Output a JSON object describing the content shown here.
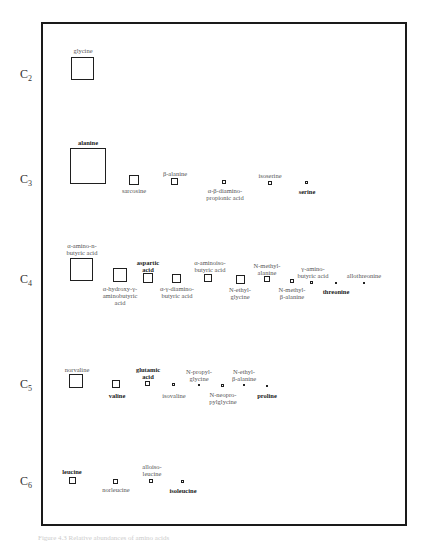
{
  "figure": {
    "type": "amino acid abundance grid by carbon number",
    "rows": [
      {
        "label": "C",
        "sub": "2",
        "y": 75,
        "items": [
          {
            "name": "glycine",
            "bold": false,
            "box": [
              71,
              57,
              23
            ],
            "label_pos": [
              83,
              47
            ],
            "lines": [
              "glycine"
            ]
          }
        ]
      },
      {
        "label": "C",
        "sub": "3",
        "y": 180,
        "items": [
          {
            "name": "alanine",
            "bold": true,
            "box": [
              70,
              148,
              36
            ],
            "label_pos": [
              88,
              139
            ],
            "lines": [
              "alanine"
            ]
          },
          {
            "name": "sarcosine",
            "bold": false,
            "box": [
              129,
              175,
              10
            ],
            "label_pos": [
              134,
              187
            ],
            "lines": [
              "sarcosine"
            ]
          },
          {
            "name": "β-alanine",
            "bold": false,
            "box": [
              171,
              178,
              7
            ],
            "label_pos": [
              175,
              170
            ],
            "lines": [
              "β-alanine"
            ]
          },
          {
            "name": "α-β-diamino-propionic acid",
            "bold": false,
            "box": [
              222,
              180,
              4
            ],
            "label_pos": [
              225,
              187
            ],
            "lines": [
              "α-β-diamino-",
              "propionic acid"
            ]
          },
          {
            "name": "isoserine",
            "bold": false,
            "box": [
              268,
              181,
              4
            ],
            "label_pos": [
              270,
              172
            ],
            "lines": [
              "isoserine"
            ]
          },
          {
            "name": "serine",
            "bold": true,
            "box": [
              305,
              181,
              3
            ],
            "label_pos": [
              307,
              188
            ],
            "lines": [
              "serine"
            ]
          }
        ]
      },
      {
        "label": "C",
        "sub": "4",
        "y": 280,
        "items": [
          {
            "name": "α-amino-n-butyric acid",
            "bold": false,
            "box": [
              70,
              258,
              23
            ],
            "label_pos": [
              82,
              242
            ],
            "lines": [
              "α-amino-n-",
              "butyric acid"
            ]
          },
          {
            "name": "α-hydroxy-γ-aminobutyric acid",
            "bold": false,
            "box": [
              113,
              268,
              14
            ],
            "label_pos": [
              120,
              285
            ],
            "lines": [
              "α-hydroxy-γ-",
              "aminobutyric",
              "acid"
            ]
          },
          {
            "name": "aspartic acid",
            "bold": true,
            "box": [
              143,
              273,
              10
            ],
            "label_pos": [
              148,
              259
            ],
            "lines": [
              "aspartic",
              "acid"
            ]
          },
          {
            "name": "α-γ-diamino-butyric acid",
            "bold": false,
            "box": [
              172,
              274,
              9
            ],
            "label_pos": [
              177,
              285
            ],
            "lines": [
              "α-γ-diamino-",
              "butyric acid"
            ]
          },
          {
            "name": "α-aminoiso-butyric acid",
            "bold": false,
            "box": [
              204,
              274,
              8
            ],
            "label_pos": [
              210,
              259
            ],
            "lines": [
              "α-aminoiso-",
              "butyric acid"
            ]
          },
          {
            "name": "N-ethylglycine",
            "bold": false,
            "box": [
              236,
              275,
              9
            ],
            "label_pos": [
              240,
              286
            ],
            "lines": [
              "N-ethyl-",
              "glycine"
            ]
          },
          {
            "name": "N-methylalanine",
            "bold": false,
            "box": [
              264,
              276,
              6
            ],
            "label_pos": [
              267,
              262
            ],
            "lines": [
              "N-methyl-",
              "alanine"
            ]
          },
          {
            "name": "N-methyl-β-alanine",
            "bold": false,
            "box": [
              290,
              279,
              4
            ],
            "label_pos": [
              292,
              286
            ],
            "lines": [
              "N-methyl-",
              "β-alanine"
            ]
          },
          {
            "name": "γ-aminobutyric acid",
            "bold": false,
            "box": [
              310,
              281,
              3
            ],
            "label_pos": [
              313,
              265
            ],
            "lines": [
              "γ-amino-",
              "butyric acid"
            ]
          },
          {
            "name": "threonine",
            "bold": true,
            "box": [
              335,
              282,
              2
            ],
            "label_pos": [
              336,
              288
            ],
            "lines": [
              "threonine"
            ]
          },
          {
            "name": "allothreonine",
            "bold": false,
            "box": [
              363,
              282,
              2
            ],
            "label_pos": [
              364,
              272
            ],
            "lines": [
              "allothreonine"
            ]
          }
        ]
      },
      {
        "label": "C",
        "sub": "5",
        "y": 385,
        "items": [
          {
            "name": "norvaline",
            "bold": false,
            "box": [
              69,
              374,
              14
            ],
            "label_pos": [
              77,
              366
            ],
            "lines": [
              "norvaline"
            ]
          },
          {
            "name": "valine",
            "bold": true,
            "box": [
              112,
              380,
              8
            ],
            "label_pos": [
              117,
              392
            ],
            "lines": [
              "valine"
            ]
          },
          {
            "name": "glutamic acid",
            "bold": true,
            "box": [
              145,
              381,
              5
            ],
            "label_pos": [
              148,
              366
            ],
            "lines": [
              "glutamic",
              "acid"
            ]
          },
          {
            "name": "isovaline",
            "bold": false,
            "box": [
              172,
              383,
              3
            ],
            "label_pos": [
              174,
              392
            ],
            "lines": [
              "isovaline"
            ]
          },
          {
            "name": "N-propylglycine",
            "bold": false,
            "box": [
              198,
              384,
              2
            ],
            "label_pos": [
              199,
              368
            ],
            "lines": [
              "N-propyl-",
              "glycine"
            ]
          },
          {
            "name": "N-neopropylglycine",
            "bold": false,
            "box": [
              221,
              384,
              3
            ],
            "label_pos": [
              223,
              391
            ],
            "lines": [
              "N-neopro-",
              "pylglycine"
            ]
          },
          {
            "name": "N-ethyl-β-alanine",
            "bold": false,
            "box": [
              243,
              384,
              2
            ],
            "label_pos": [
              244,
              368
            ],
            "lines": [
              "N-ethyl-",
              "β-alanine"
            ]
          },
          {
            "name": "proline",
            "bold": true,
            "box": [
              266,
              385,
              1.5
            ],
            "label_pos": [
              267,
              392
            ],
            "lines": [
              "proline"
            ]
          }
        ]
      },
      {
        "label": "C",
        "sub": "6",
        "y": 482,
        "items": [
          {
            "name": "leucine",
            "bold": true,
            "box": [
              69,
              477,
              7
            ],
            "label_pos": [
              72,
              468
            ],
            "lines": [
              "leucine"
            ]
          },
          {
            "name": "norleucine",
            "bold": false,
            "box": [
              113,
              479,
              5
            ],
            "label_pos": [
              116,
              486
            ],
            "lines": [
              "norleucine"
            ]
          },
          {
            "name": "alloisoleucine",
            "bold": false,
            "box": [
              149,
              479,
              4
            ],
            "label_pos": [
              152,
              463
            ],
            "lines": [
              "alloiso-",
              "leucine"
            ]
          },
          {
            "name": "isoleucine",
            "bold": true,
            "box": [
              181,
              480,
              3
            ],
            "label_pos": [
              183,
              487
            ],
            "lines": [
              "isoleucine"
            ]
          }
        ]
      }
    ]
  },
  "caption": "Figure 4.3  Relative abundances of amino acids"
}
